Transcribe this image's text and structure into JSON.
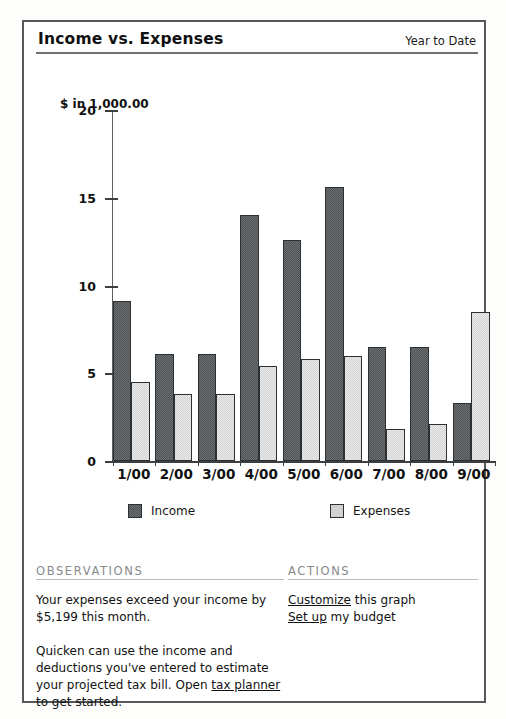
{
  "header": {
    "title": "Income vs. Expenses",
    "period": "Year to Date"
  },
  "chart_data": {
    "type": "bar",
    "title": "Income vs. Expenses",
    "subtitle": "Year to Date",
    "axis_unit_label": "$ in 1,000.00",
    "xlabel": "",
    "ylabel": "$ in 1,000.00",
    "ylim": [
      0,
      20
    ],
    "yticks": [
      0,
      5,
      10,
      15,
      20
    ],
    "ytick_labels": [
      "0",
      "5",
      "10",
      "15",
      "20"
    ],
    "grid": false,
    "legend_position": "bottom",
    "categories": [
      "1/00",
      "2/00",
      "3/00",
      "4/00",
      "5/00",
      "6/00",
      "7/00",
      "8/00",
      "9/00"
    ],
    "series": [
      {
        "name": "Income",
        "color": "#4f5356",
        "values": [
          9.1,
          6.1,
          6.1,
          14.0,
          12.6,
          15.6,
          6.5,
          6.5,
          3.3
        ]
      },
      {
        "name": "Expenses",
        "color": "#d2d2d2",
        "values": [
          4.5,
          3.8,
          3.8,
          5.4,
          5.8,
          6.0,
          1.8,
          2.1,
          8.5
        ]
      }
    ]
  },
  "legend": [
    {
      "label": "Income",
      "swatch": "income"
    },
    {
      "label": "Expenses",
      "swatch": "expenses"
    }
  ],
  "observations": {
    "heading": "OBSERVATIONS",
    "paragraph1": "Your expenses exceed your income by $5,199 this month.",
    "paragraph2_before_link": "Quicken can use the income and deductions you've entered to estimate your projected tax bill. Open ",
    "paragraph2_link": "tax planner",
    "paragraph2_after_link": " to get started."
  },
  "actions": {
    "heading": "ACTIONS",
    "items": [
      {
        "link": "Customize",
        "rest": " this graph"
      },
      {
        "link": "Set up",
        "rest": " my budget"
      }
    ]
  }
}
